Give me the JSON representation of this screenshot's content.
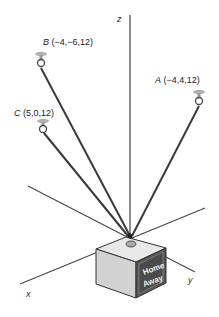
{
  "diagram": {
    "type": "3d-force-diagram",
    "axes": {
      "x": {
        "label": "x"
      },
      "y": {
        "label": "y"
      },
      "z": {
        "label": "z"
      }
    },
    "anchors": [
      {
        "name": "A",
        "coords": "(−4,4,12)",
        "label": "A (−4,4,12)"
      },
      {
        "name": "B",
        "coords": "(−4,−6,12)",
        "label": "B (−4,−6,12)"
      },
      {
        "name": "C",
        "coords": "(5,0,12)",
        "label": "C (5,0,12)"
      }
    ],
    "box": {
      "line1": "Home",
      "line2": "Away"
    },
    "colors": {
      "line": "#3a3a3a",
      "box_front": "#d4d4d4",
      "box_side": "#505050",
      "box_top": "#e6e6e6",
      "hook": "#aaaaaa"
    }
  }
}
